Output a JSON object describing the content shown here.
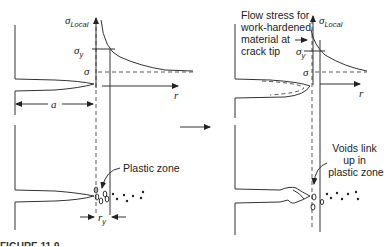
{
  "diagram": {
    "left_panel": {
      "y_axis_label": "σ",
      "y_axis_subscript": "Local",
      "x_axis_label": "r",
      "yield_label": "σ",
      "yield_subscript": "y",
      "applied_stress_label": "σ",
      "crack_length_label": "a",
      "plastic_zone_label": "Plastic zone",
      "plastic_zone_size_label": "r",
      "plastic_zone_size_subscript": "y"
    },
    "transition_arrow": "→",
    "right_panel": {
      "y_axis_label": "σ",
      "y_axis_subscript": "Local",
      "x_axis_label": "r",
      "yield_label": "σ",
      "yield_subscript": "y",
      "applied_stress_label": "σ",
      "flow_stress_label_lines": [
        "Flow stress for",
        "work-hardened",
        "material at",
        "crack tip"
      ],
      "voids_label_lines": [
        "Voids link",
        "up in",
        "plastic zone"
      ]
    },
    "caption_partial": "FIGURE 11.9"
  }
}
